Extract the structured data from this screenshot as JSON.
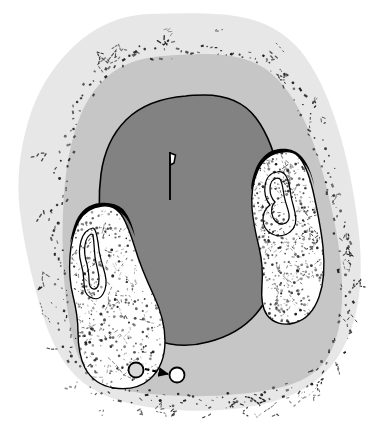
{
  "figure": {
    "domain_label": "anatomical-cross-section",
    "canvas": {
      "width": 377,
      "height": 432,
      "background": "#ffffff"
    },
    "caption": "",
    "title": ""
  },
  "palette": {
    "background": "#ffffff",
    "outer_tissue": "#e7e7e7",
    "mid_tissue": "#c6c6c6",
    "core_region": "#828282",
    "lobe_fill": "#ffffff",
    "stroke_black": "#000000",
    "stipple": "#1a1a1a",
    "marker_fill": "#ffffff"
  },
  "regions": {
    "outer_boundary": {
      "name": "outer-tissue-boundary",
      "fill": "#e7e7e7",
      "stroke": "none",
      "label": "Outer tissue envelope",
      "path": "M 150 14 C 118 15 92 28 70 50 C 50 70 36 94 28 122 C 20 150 16 180 20 212 C 24 246 32 278 40 306 C 48 334 58 356 72 372 C 86 388 106 398 132 404 C 158 410 190 412 222 410 C 252 408 278 402 298 392 C 318 382 332 368 342 350 C 352 332 358 310 360 286 C 362 262 360 236 356 210 C 352 182 346 154 338 128 C 330 102 320 78 306 58 C 292 38 272 24 246 18 C 220 12 184 13 150 14 Z"
    },
    "mid_boundary": {
      "name": "mid-tissue-boundary",
      "fill": "#c6c6c6",
      "stroke": "none",
      "label": "Middle tissue zone",
      "path": "M 162 56 C 140 58 122 64 108 76 C 94 88 84 104 78 122 C 70 144 66 168 64 194 C 62 222 62 250 64 278 C 66 306 70 330 76 350 C 82 368 92 380 108 386 C 126 392 152 395 182 396 C 216 397 252 394 278 388 C 300 383 316 374 326 360 C 336 345 341 325 342 302 C 343 276 340 248 334 220 C 328 190 320 160 310 134 C 300 108 288 88 272 74 C 256 60 234 54 206 54 C 190 54 174 55 162 56 Z"
    },
    "core": {
      "name": "core-dark-region",
      "fill": "#828282",
      "stroke": "#000000",
      "stroke_width": 1.6,
      "label": "Central dark core",
      "path": "M 186 96 C 160 98 140 106 126 120 C 112 134 104 152 101 174 C 98 196 99 220 103 244 C 107 268 113 288 120 304 C 128 322 140 334 156 340 C 172 346 190 347 208 342 C 228 337 244 328 256 314 C 268 300 276 282 280 260 C 284 236 284 208 280 182 C 276 156 268 134 256 118 C 244 102 226 95 204 95 C 198 95 192 95 186 96 Z"
    }
  },
  "lobes": [
    {
      "name": "left-lobe",
      "label": "Left stippled lobe",
      "fill": "#ffffff",
      "stroke": "#000000",
      "stroke_width": 1.4,
      "path": "M 102 206 C 92 207 84 212 79 221 C 74 230 71 242 70 256 C 69 270 70 284 73 296 C 76 308 78 320 78 332 C 78 346 80 358 85 368 C 91 379 101 386 114 388 C 128 390 141 387 150 379 C 160 370 165 357 165 341 C 165 326 161 311 154 296 C 147 281 140 265 135 248 C 130 232 126 220 120 213 C 115 207 109 205 102 206 Z",
      "cap": {
        "name": "left-lobe-cap",
        "fill": "#000000",
        "path": "M 100 203 C 89 204 81 210 76 221 C 73 228 71 236 70 244 C 74 232 79 222 86 216 C 93 210 101 208 110 209 C 118 210 124 214 128 221 C 131 226 133 231 135 237 C 133 226 129 216 123 209 C 117 204 109 202 100 203 Z"
      },
      "inner_contours": [
        {
          "name": "left-lobe-inner-contour-outer",
          "path": "M 93 228 C 87 229 83 234 81 241 C 79 248 79 256 81 263 C 83 270 84 277 84 283 C 84 290 86 295 90 297 C 95 300 100 299 103 294 C 106 289 107 282 105 274 C 103 266 100 258 99 250 C 98 241 97 234 95 230 C 94 228 94 228 93 228 Z"
        },
        {
          "name": "left-lobe-inner-contour-inner",
          "path": "M 92 234 C 88 235 86 239 85 245 C 84 251 85 258 87 264 C 88 269 89 275 89 280 C 89 286 91 289 94 289 C 97 289 99 285 99 279 C 99 272 96 265 95 257 C 94 248 94 240 93 236 C 93 234 92 234 92 234 Z"
        }
      ]
    },
    {
      "name": "right-lobe",
      "label": "Right stippled lobe",
      "fill": "#ffffff",
      "stroke": "#000000",
      "stroke_width": 1.4,
      "path": "M 282 152 C 271 153 263 159 258 170 C 253 181 251 194 252 208 C 253 222 256 235 259 247 C 262 260 263 273 262 285 C 261 298 262 308 267 315 C 273 323 283 326 294 323 C 306 320 314 311 319 297 C 324 283 325 266 323 247 C 321 228 317 209 313 191 C 309 174 304 162 298 156 C 293 151 288 151 282 152 Z",
      "cap": {
        "name": "right-lobe-cap",
        "fill": "#000000",
        "path": "M 279 149 C 269 150 261 157 256 168 C 253 175 251 183 251 191 C 255 179 260 169 267 163 C 275 156 284 154 292 156 C 300 158 306 164 310 173 C 312 178 314 184 315 190 C 313 177 309 165 302 157 C 296 150 288 148 279 149 Z"
      },
      "inner_contours": [
        {
          "name": "right-lobe-inner-contour-outer",
          "path": "M 277 172 C 270 173 266 178 265 186 C 264 193 266 200 270 205 C 266 208 263 213 263 219 C 263 226 266 231 272 234 C 278 237 285 236 290 232 C 295 228 297 221 295 213 C 294 207 292 202 291 196 C 290 188 289 181 286 176 C 284 173 281 171 277 172 Z"
        },
        {
          "name": "right-lobe-inner-contour-inner",
          "path": "M 277 178 C 272 179 270 183 270 189 C 270 194 272 199 275 202 C 272 205 271 209 272 214 C 273 220 277 224 282 224 C 287 224 290 220 289 214 C 288 208 285 202 284 195 C 283 188 282 182 280 179 C 279 178 278 178 277 178 Z"
        }
      ]
    }
  ],
  "markers": {
    "center_needle": {
      "name": "center-needle-marker",
      "label": "Central needle/flag marker",
      "x": 170,
      "y": 152,
      "height": 48,
      "stroke": "#000000",
      "flag_fill": "#ffffff"
    },
    "source_circle": {
      "name": "source-circle",
      "label": "Source circle inside left lobe",
      "cx": 136,
      "cy": 370,
      "r": 7.5,
      "fill": "#d9d9d9",
      "stroke": "#000000"
    },
    "target_circle": {
      "name": "target-circle",
      "label": "Target circle outside lobe",
      "cx": 177,
      "cy": 375,
      "r": 7.5,
      "fill": "#ffffff",
      "stroke": "#000000"
    },
    "arrow": {
      "name": "migration-arrow",
      "label": "Dashed migration arrow",
      "x1": 145,
      "y1": 369,
      "x2": 168,
      "y2": 374,
      "style": "dashed",
      "stroke": "#000000"
    }
  },
  "texture": {
    "stipple_seed": 20240521,
    "lobe_dot_count": 430,
    "boundary_dash_count": 260,
    "lobe_dot_radius": 0.85,
    "lobe_streak_count": 110
  }
}
